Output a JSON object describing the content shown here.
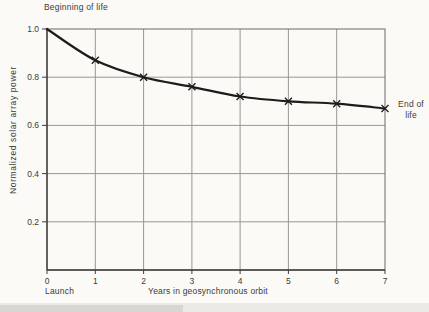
{
  "figure": {
    "background_color": "#fbfaf7",
    "annotations": {
      "beginning_of_life": "Beginning of life",
      "end_of_life": "End of life",
      "launch": "Launch"
    }
  },
  "chart_data": {
    "type": "line",
    "title": "",
    "xlabel": "Years in geosynchronous orbit",
    "ylabel": "Normalized solar array power",
    "x": [
      0,
      1,
      2,
      3,
      4,
      5,
      6,
      7
    ],
    "values": [
      1.0,
      0.87,
      0.8,
      0.76,
      0.72,
      0.7,
      0.69,
      0.67
    ],
    "xlim": [
      0,
      7
    ],
    "ylim": [
      0,
      1.0
    ],
    "x_ticks": [
      "0",
      "1",
      "2",
      "3",
      "4",
      "5",
      "6",
      "7"
    ],
    "y_ticks": [
      "1.0",
      "0.8",
      "0.6",
      "0.4",
      "0.2"
    ],
    "y_tick_values": [
      1.0,
      0.8,
      0.6,
      0.4,
      0.2
    ],
    "x_grid_values": [
      1,
      2,
      3,
      4,
      5,
      6
    ],
    "y_grid_values": [
      0.8,
      0.6,
      0.4,
      0.2
    ],
    "grid": true,
    "legend": "none",
    "marker": "x",
    "marker_x": [
      1,
      2,
      3,
      4,
      5,
      6,
      7
    ],
    "annotations": [
      {
        "text": "Beginning of life",
        "at": "start-of-curve"
      },
      {
        "text": "End of life",
        "at": "end-of-curve"
      },
      {
        "text": "Launch",
        "at": "x-origin"
      }
    ],
    "line_color": "#1c1c1a",
    "grid_color": "#979795",
    "frame_color": "#6b6b68",
    "axis_color": "#3f3f3c",
    "text_color": "#3b3b39"
  }
}
